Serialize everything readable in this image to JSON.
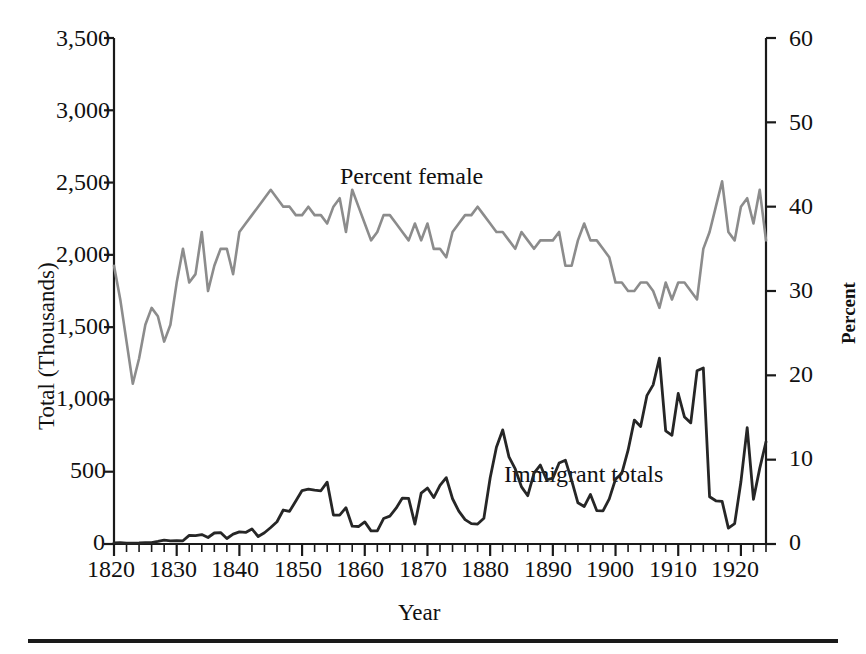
{
  "chart_data": {
    "type": "line",
    "title": "",
    "subtitle": "",
    "xlabel": "Year",
    "ylabel": "Total (Thousands)",
    "y2label": "Percent",
    "xlim": [
      1820,
      1924
    ],
    "ylim": [
      0,
      3500
    ],
    "y2lim": [
      0,
      60
    ],
    "grid": false,
    "legend_position": "inline-annotation",
    "xticks": [
      1820,
      1830,
      1840,
      1850,
      1860,
      1870,
      1880,
      1890,
      1900,
      1910,
      1920
    ],
    "xtick_labels": [
      "1820",
      "1830",
      "1840",
      "1850",
      "1860",
      "1870",
      "1880",
      "1890",
      "1900",
      "1910",
      "1920"
    ],
    "xminor_tick_interval": 2,
    "yticks": [
      0,
      500,
      1000,
      1500,
      2000,
      2500,
      3000,
      3500
    ],
    "ytick_labels": [
      "0",
      "500",
      "1,000",
      "1,500",
      "2,000",
      "2,500",
      "3,000",
      "3,500"
    ],
    "y2ticks": [
      0,
      10,
      20,
      30,
      40,
      50,
      60
    ],
    "y2tick_labels": [
      "0",
      "10",
      "20",
      "30",
      "40",
      "50",
      "60"
    ],
    "annotations": [
      {
        "text": "Percent female",
        "x": 1862,
        "y_axis": "right",
        "color": "#1a1a1a"
      },
      {
        "text": "Immigrant totals",
        "x": 1894,
        "y_axis": "left",
        "color": "#1a1a1a"
      }
    ],
    "x": [
      1820,
      1821,
      1822,
      1823,
      1824,
      1825,
      1826,
      1827,
      1828,
      1829,
      1830,
      1831,
      1832,
      1833,
      1834,
      1835,
      1836,
      1837,
      1838,
      1839,
      1840,
      1841,
      1842,
      1843,
      1844,
      1845,
      1846,
      1847,
      1848,
      1849,
      1850,
      1851,
      1852,
      1853,
      1854,
      1855,
      1856,
      1857,
      1858,
      1859,
      1860,
      1861,
      1862,
      1863,
      1864,
      1865,
      1866,
      1867,
      1868,
      1869,
      1870,
      1871,
      1872,
      1873,
      1874,
      1875,
      1876,
      1877,
      1878,
      1879,
      1880,
      1881,
      1882,
      1883,
      1884,
      1885,
      1886,
      1887,
      1888,
      1889,
      1890,
      1891,
      1892,
      1893,
      1894,
      1895,
      1896,
      1897,
      1898,
      1899,
      1900,
      1901,
      1902,
      1903,
      1904,
      1905,
      1906,
      1907,
      1908,
      1909,
      1910,
      1911,
      1912,
      1913,
      1914,
      1915,
      1916,
      1917,
      1918,
      1919,
      1920,
      1921,
      1922,
      1923,
      1924
    ],
    "series": [
      {
        "name": "Immigrant totals",
        "axis": "left",
        "unit": "thousands",
        "color": "#262626",
        "values": [
          8,
          9,
          6,
          6,
          7,
          10,
          10,
          18,
          27,
          22,
          23,
          22,
          60,
          58,
          65,
          45,
          76,
          79,
          38,
          68,
          84,
          80,
          104,
          52,
          78,
          114,
          154,
          235,
          226,
          297,
          370,
          379,
          372,
          368,
          428,
          200,
          200,
          251,
          123,
          121,
          153,
          91,
          91,
          176,
          193,
          248,
          318,
          315,
          138,
          352,
          387,
          321,
          405,
          459,
          313,
          227,
          169,
          141,
          138,
          178,
          457,
          669,
          789,
          603,
          519,
          395,
          334,
          490,
          546,
          444,
          455,
          560,
          580,
          440,
          285,
          259,
          343,
          231,
          229,
          312,
          449,
          488,
          649,
          857,
          813,
          1026,
          1101,
          1285,
          783,
          752,
          1041,
          878,
          838,
          1198,
          1218,
          327,
          299,
          295,
          110,
          141,
          430,
          805,
          309,
          523,
          707
        ]
      },
      {
        "name": "Percent female",
        "axis": "right",
        "unit": "percent",
        "color": "#8c8c8c",
        "values": [
          33,
          29,
          24,
          19,
          22,
          26,
          28,
          27,
          24,
          26,
          31,
          35,
          31,
          32,
          37,
          30,
          33,
          35,
          35,
          32,
          37,
          38,
          39,
          40,
          41,
          42,
          41,
          40,
          40,
          39,
          39,
          40,
          39,
          39,
          38,
          40,
          41,
          37,
          42,
          40,
          38,
          36,
          37,
          39,
          39,
          38,
          37,
          36,
          38,
          36,
          38,
          35,
          35,
          34,
          37,
          38,
          39,
          39,
          40,
          39,
          38,
          37,
          37,
          36,
          35,
          37,
          36,
          35,
          36,
          36,
          36,
          37,
          33,
          33,
          36,
          38,
          36,
          36,
          35,
          34,
          31,
          31,
          30,
          30,
          31,
          31,
          30,
          28,
          31,
          29,
          31,
          31,
          30,
          29,
          35,
          37,
          40,
          43,
          37,
          36,
          40,
          41,
          38,
          42,
          36
        ]
      }
    ]
  },
  "axes": {
    "ylabel_left": "Total (Thousands)",
    "ylabel_right": "Percent",
    "xlabel": "Year"
  }
}
